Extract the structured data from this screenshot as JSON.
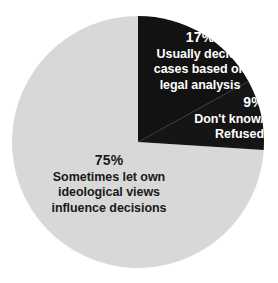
{
  "chart_data": {
    "type": "pie",
    "title": "",
    "subtitle": "",
    "legend_position": "none",
    "grid": false,
    "start_angle_deg": 0,
    "direction": "clockwise",
    "center": {
      "x": 138,
      "y": 142
    },
    "radius": 126,
    "categories": [
      "Usually decide cases based on legal analysis",
      "Don't know/ Refused",
      "Sometimes let own ideological views influence decisions"
    ],
    "values": [
      17,
      9,
      75
    ],
    "value_unit": "%",
    "slices": [
      {
        "id": "legal-analysis",
        "percent_label": "17%",
        "value": 17,
        "color": "#121212",
        "text_color": "#ffffff",
        "description_lines": [
          "Usually decide",
          "cases based on",
          "legal analysis"
        ],
        "start_angle_deg": 0,
        "end_angle_deg": 61.2
      },
      {
        "id": "dont-know",
        "percent_label": "9%",
        "value": 9,
        "color": "#151515",
        "text_color": "#ffffff",
        "description_lines": [
          "Don't know/",
          "Refused"
        ],
        "start_angle_deg": 61.2,
        "end_angle_deg": 93.6
      },
      {
        "id": "ideological-views",
        "percent_label": "75%",
        "value": 75,
        "color": "#d8d8d8",
        "text_color": "#1a1a1a",
        "description_lines": [
          "Sometimes let own",
          "ideological views",
          "influence decisions"
        ],
        "start_angle_deg": 93.6,
        "end_angle_deg": 360
      }
    ],
    "colors": {
      "background": "#ffffff",
      "slice_dark": "#121212",
      "slice_dark_alt": "#151515",
      "slice_light": "#d8d8d8",
      "label_on_dark": "#ffffff",
      "label_on_light": "#1a1a1a"
    }
  }
}
